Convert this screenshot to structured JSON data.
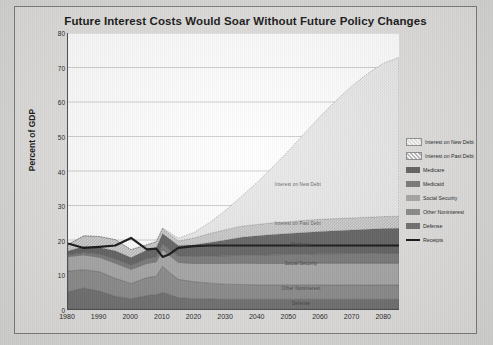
{
  "chart_data": {
    "type": "area",
    "title": "Future Interest Costs Would Soar Without Future Policy Changes",
    "xlabel": "",
    "ylabel": "Percent of GDP",
    "xlim": [
      1980,
      2085
    ],
    "ylim": [
      0,
      80
    ],
    "ytick_values": [
      0,
      10,
      20,
      30,
      40,
      50,
      60,
      70,
      80
    ],
    "xtick_values": [
      1980,
      1990,
      2000,
      2010,
      2020,
      2030,
      2040,
      2050,
      2060,
      2070,
      2080
    ],
    "grid": true,
    "legend_position": "right",
    "stacked": true,
    "x": [
      1980,
      1985,
      1990,
      1995,
      2000,
      2005,
      2008,
      2010,
      2012,
      2015,
      2020,
      2025,
      2030,
      2035,
      2040,
      2045,
      2050,
      2055,
      2060,
      2065,
      2070,
      2075,
      2080,
      2085
    ],
    "series": [
      {
        "name": "Defense",
        "color": "#6e6e6e",
        "pattern": "solid",
        "values": [
          5.0,
          6.1,
          5.2,
          3.7,
          3.0,
          3.9,
          4.2,
          4.8,
          4.3,
          3.3,
          3.0,
          2.9,
          2.8,
          2.8,
          2.8,
          2.8,
          2.8,
          2.8,
          2.8,
          2.8,
          2.8,
          2.8,
          2.8,
          2.8
        ]
      },
      {
        "name": "Other Noninterest",
        "color": "#8a8a8a",
        "pattern": "solid",
        "values": [
          6.0,
          5.3,
          5.6,
          5.2,
          4.4,
          5.2,
          5.3,
          7.6,
          6.5,
          5.3,
          4.9,
          4.6,
          4.4,
          4.3,
          4.2,
          4.2,
          4.2,
          4.2,
          4.2,
          4.2,
          4.2,
          4.2,
          4.2,
          4.2
        ]
      },
      {
        "name": "Social Security",
        "color": "#a5a5a5",
        "pattern": "solid",
        "values": [
          4.2,
          4.3,
          4.2,
          4.4,
          4.1,
          4.1,
          4.2,
          4.8,
          4.9,
          4.9,
          5.3,
          5.7,
          6.0,
          6.2,
          6.2,
          6.2,
          6.2,
          6.3,
          6.3,
          6.3,
          6.3,
          6.3,
          6.3,
          6.3
        ]
      },
      {
        "name": "Medicaid",
        "color": "#777777",
        "pattern": "solid",
        "values": [
          0.5,
          0.7,
          0.9,
          1.2,
          1.2,
          1.4,
          1.4,
          1.7,
          1.7,
          1.8,
          2.0,
          2.1,
          2.2,
          2.3,
          2.4,
          2.5,
          2.6,
          2.6,
          2.7,
          2.7,
          2.8,
          2.8,
          2.9,
          2.9
        ]
      },
      {
        "name": "Medicare",
        "color": "#606060",
        "pattern": "solid",
        "values": [
          1.1,
          1.7,
          1.9,
          2.4,
          2.2,
          2.5,
          2.7,
          3.0,
          3.1,
          3.1,
          3.4,
          4.0,
          4.6,
          5.2,
          5.6,
          5.9,
          6.1,
          6.3,
          6.5,
          6.7,
          6.8,
          7.0,
          7.1,
          7.2
        ]
      },
      {
        "name": "Interest on Past Debt",
        "color": "#b8b8b8",
        "pattern": "hatched",
        "values": [
          1.9,
          3.1,
          3.2,
          3.2,
          2.3,
          1.5,
          1.7,
          1.4,
          1.4,
          1.3,
          2.0,
          2.6,
          3.0,
          3.2,
          3.3,
          3.4,
          3.4,
          3.5,
          3.5,
          3.5,
          3.5,
          3.5,
          3.5,
          3.5
        ]
      },
      {
        "name": "Interest on New Debt",
        "color": "#e2e2e2",
        "pattern": "hatched",
        "values": [
          0.0,
          0.0,
          0.0,
          0.0,
          0.0,
          0.0,
          0.0,
          0.2,
          0.4,
          0.8,
          1.6,
          3.2,
          5.6,
          8.6,
          12.2,
          16.2,
          20.6,
          25.2,
          29.8,
          34.2,
          38.2,
          41.6,
          44.4,
          46.0
        ]
      }
    ],
    "line_series": {
      "name": "Receipts",
      "color": "#111111",
      "values": [
        19.0,
        17.7,
        18.0,
        18.4,
        20.6,
        17.3,
        17.5,
        15.1,
        15.8,
        17.7,
        18.2,
        18.4,
        18.4,
        18.4,
        18.4,
        18.4,
        18.4,
        18.4,
        18.4,
        18.4,
        18.4,
        18.4,
        18.4,
        18.4
      ]
    },
    "plot_annotations": [
      {
        "label": "Interest on New Debt",
        "x": 2053,
        "y": 36.5
      },
      {
        "label": "Interest on Past Debt",
        "x": 2053,
        "y": 25.0
      },
      {
        "label": "Medicare",
        "x": 2054,
        "y": 19.0
      },
      {
        "label": "Social Security",
        "x": 2054,
        "y": 13.5
      },
      {
        "label": "Other Noninterest",
        "x": 2054,
        "y": 6.3
      },
      {
        "label": "Defense",
        "x": 2054,
        "y": 1.9
      }
    ],
    "legend": [
      {
        "label": "Interest on New Debt",
        "color": "#e2e2e2",
        "style": "hatched"
      },
      {
        "label": "Interest on Past Debt",
        "color": "#b8b8b8",
        "style": "hatched"
      },
      {
        "label": "Medicare",
        "color": "#606060",
        "style": "solid"
      },
      {
        "label": "Medicaid",
        "color": "#777777",
        "style": "solid"
      },
      {
        "label": "Social Security",
        "color": "#a5a5a5",
        "style": "solid"
      },
      {
        "label": "Other Noninterest",
        "color": "#8a8a8a",
        "style": "solid"
      },
      {
        "label": "Defense",
        "color": "#6e6e6e",
        "style": "solid"
      },
      {
        "label": "Receipts",
        "color": "#111111",
        "style": "line"
      }
    ]
  }
}
